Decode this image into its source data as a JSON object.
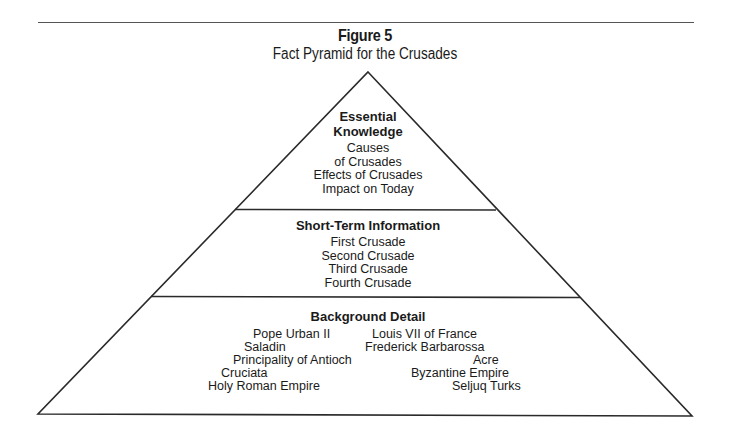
{
  "figure": {
    "label": "Figure 5",
    "title": "Fact Pyramid for the Crusades"
  },
  "pyramid": {
    "tiers": [
      {
        "heading_lines": [
          "Essential",
          "Knowledge"
        ],
        "items": [
          "Causes",
          "of Crusades",
          "Effects of Crusades",
          "Impact on Today"
        ]
      },
      {
        "heading": "Short-Term Information",
        "items": [
          "First Crusade",
          "Second Crusade",
          "Third Crusade",
          "Fourth Crusade"
        ]
      },
      {
        "heading": "Background Detail",
        "left_items": [
          "Pope Urban II",
          "Saladin",
          "Principality of Antioch",
          "Cruciata",
          "Holy Roman Empire"
        ],
        "right_items": [
          "Louis VII of France",
          "Frederick Barbarossa",
          "Acre",
          "Byzantine Empire",
          "Seljuq Turks"
        ]
      }
    ]
  },
  "colors": {
    "line": "#2a2a2a",
    "text": "#1a1a1a",
    "background": "#ffffff"
  }
}
